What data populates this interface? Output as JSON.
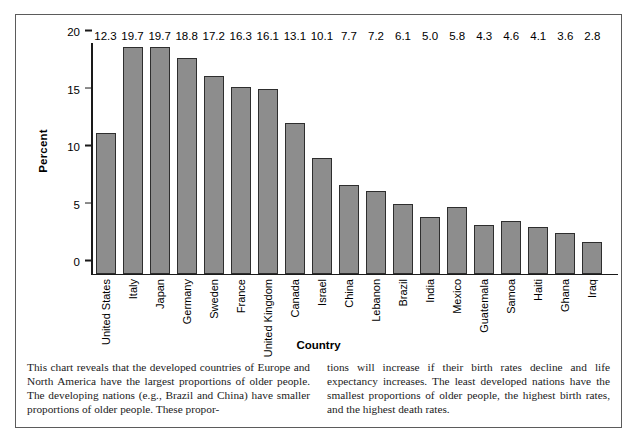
{
  "chart_data": {
    "type": "bar",
    "title": "",
    "xlabel": "Country",
    "ylabel": "Percent",
    "ylim": [
      0,
      20
    ],
    "yticks": [
      0,
      5,
      10,
      15,
      20
    ],
    "grid": false,
    "legend": "none",
    "bar_color": "#8d8d8d",
    "bar_border_color": "#2e2e2e",
    "categories": [
      "United States",
      "Italy",
      "Japan",
      "Germany",
      "Sweden",
      "France",
      "United Kingdom",
      "Canada",
      "Israel",
      "China",
      "Lebanon",
      "Brazil",
      "India",
      "Mexico",
      "Guatemala",
      "Samoa",
      "Haiti",
      "Ghana",
      "Iraq"
    ],
    "values": [
      12.3,
      19.7,
      19.7,
      18.8,
      17.2,
      16.3,
      16.1,
      13.1,
      10.1,
      7.7,
      7.2,
      6.1,
      5.0,
      5.8,
      4.3,
      4.6,
      4.1,
      3.6,
      2.8
    ],
    "value_labels": [
      "12.3",
      "19.7",
      "19.7",
      "18.8",
      "17.2",
      "16.3",
      "16.1",
      "13.1",
      "10.1",
      "7.7",
      "7.2",
      "6.1",
      "5.0",
      "5.8",
      "4.3",
      "4.6",
      "4.1",
      "3.6",
      "2.8"
    ]
  },
  "caption": {
    "left_column": "This chart reveals that the developed countries of Europe and North America have the largest proportions of older people. The developing nations (e.g., Brazil and China) have smaller proportions of older people. These propor-",
    "right_column": "tions will increase if their birth rates decline and life expectancy increases. The least developed nations have the smallest proportions of older people, the highest birth rates, and the highest death rates."
  }
}
